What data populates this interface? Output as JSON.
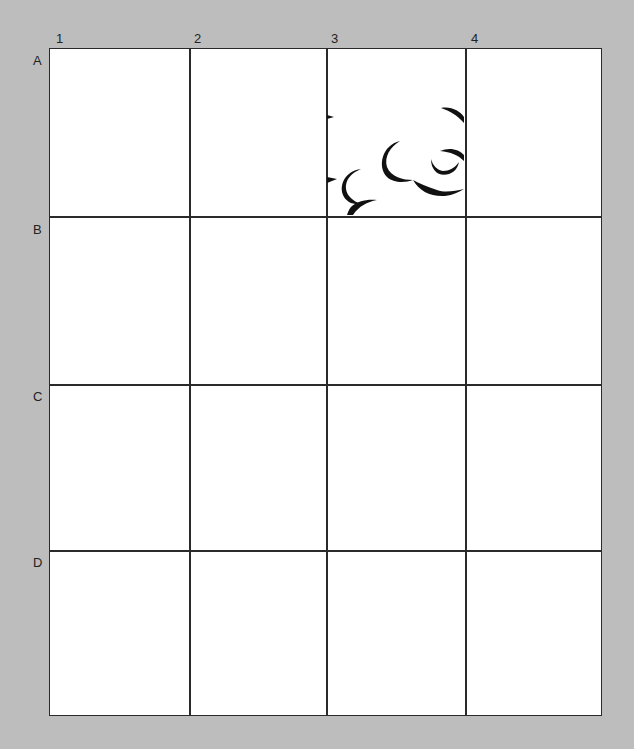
{
  "worksheet": {
    "column_labels": [
      "1",
      "2",
      "3",
      "4"
    ],
    "row_labels": [
      "A",
      "B",
      "C",
      "D"
    ],
    "filled_cells": [
      {
        "cell": "A3",
        "content": "partial-cloud-drawing"
      }
    ],
    "colors": {
      "background": "#bdbdbd",
      "grid_fill": "#ffffff",
      "line": "#2a2a2a",
      "ink": "#111111"
    }
  }
}
